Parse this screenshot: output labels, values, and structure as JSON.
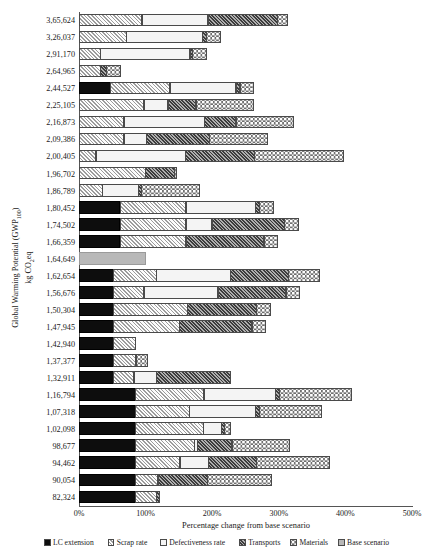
{
  "axes": {
    "y_title_line1": "Global Warming Potential (GWP",
    "y_title_sub": "100",
    "y_title_line1_end": ")",
    "y_title_line2_a": "kg CO",
    "y_title_line2_sub": "2",
    "y_title_line2_b": "eq",
    "x_title": "Percentage change from base scenario",
    "x_ticks": [
      "0%",
      "100%",
      "200%",
      "300%",
      "400%",
      "500%"
    ],
    "x_min": 0,
    "x_max": 500
  },
  "legend": {
    "items": [
      {
        "label": "LC extension",
        "key": "lc-extension",
        "color": "#0d0d0d"
      },
      {
        "label": "Scrap rate",
        "key": "scrap-rate",
        "color": "#c9c9c9"
      },
      {
        "label": "Defectiveness rate",
        "key": "defectiveness-rate",
        "color": "#f4f4f4"
      },
      {
        "label": "Transports",
        "key": "transports",
        "color": "#6e6e6e"
      },
      {
        "label": "Materials",
        "key": "materials",
        "color": "#f2f2f2"
      },
      {
        "label": "Base scenario",
        "key": "base-scenario",
        "color": "#b8b8b8"
      }
    ]
  },
  "chart_data": {
    "type": "bar",
    "orientation": "horizontal",
    "stacked": true,
    "title": "",
    "xlabel": "Percentage change from base scenario",
    "ylabel": "Global Warming Potential (GWP100) kg CO2eq",
    "xlim": [
      0,
      500
    ],
    "xticks": [
      0,
      100,
      200,
      300,
      400,
      500
    ],
    "grid": false,
    "legend_position": "bottom",
    "series": [
      {
        "name": "LC extension",
        "values": [
          0,
          0,
          0,
          0,
          48,
          0,
          0,
          0,
          0,
          0,
          0,
          62,
          62,
          62,
          0,
          52,
          52,
          52,
          52,
          52,
          52,
          52,
          85,
          85,
          85,
          85,
          85,
          85,
          85
        ]
      },
      {
        "name": "Scrap rate",
        "values": [
          95,
          72,
          33,
          33,
          90,
          98,
          68,
          68,
          26,
          100,
          36,
          100,
          100,
          100,
          0,
          66,
          47,
          112,
          100,
          35,
          35,
          32,
          104,
          82,
          103,
          90,
          68,
          35,
          33
        ]
      },
      {
        "name": "Defectiveness rate",
        "values": [
          100,
          115,
          135,
          0,
          100,
          37,
          122,
          35,
          135,
          0,
          55,
          105,
          40,
          0,
          0,
          112,
          112,
          0,
          0,
          0,
          0,
          0,
          108,
          100,
          28,
          88,
          44,
          48,
          0
        ]
      },
      {
        "name": "Transports",
        "values": [
          105,
          7,
          5,
          10,
          7,
          43,
          48,
          95,
          105,
          45,
          5,
          7,
          110,
          118,
          0,
          88,
          103,
          105,
          110,
          0,
          0,
          0,
          7,
          7,
          0,
          53,
          73,
          75,
          6
        ]
      },
      {
        "name": "Materials",
        "values": [
          17,
          22,
          22,
          22,
          22,
          87,
          88,
          88,
          135,
          0,
          88,
          22,
          22,
          22,
          0,
          88,
          88,
          22,
          22,
          0,
          0,
          0,
          110,
          95,
          22,
          88,
          110,
          0,
          0
        ]
      },
      {
        "name": "Base scenario",
        "values": [
          0,
          0,
          0,
          0,
          0,
          0,
          0,
          0,
          0,
          0,
          0,
          0,
          0,
          0,
          100,
          0,
          0,
          0,
          0,
          0,
          0,
          0,
          0,
          0,
          0,
          0,
          0,
          0,
          0
        ]
      }
    ],
    "categories": [
      "3,65,624",
      "3,26,037",
      "2,91,170",
      "2,64,965",
      "2,44,527",
      "2,25,105",
      "2,16,873",
      "2,09,386",
      "2,00,405",
      "1,96,702",
      "1,86,789",
      "1,80,452",
      "1,74,502",
      "1,66,359",
      "1,64,649",
      "1,62,654",
      "1,56,676",
      "1,50,304",
      "1,47,945",
      "1,42,940",
      "1,37,377",
      "1,32,911",
      "1,16,794",
      "1,07,318",
      "1,02,098",
      "98,677",
      "94,462",
      "90,054",
      "82,324"
    ]
  },
  "rows": [
    {
      "label": "3,65,624",
      "segs": [
        {
          "k": "scrap",
          "v": 95
        },
        {
          "k": "def",
          "v": 100
        },
        {
          "k": "trans",
          "v": 105
        },
        {
          "k": "mat",
          "v": 17
        }
      ]
    },
    {
      "label": "3,26,037",
      "segs": [
        {
          "k": "scrap",
          "v": 72
        },
        {
          "k": "def",
          "v": 115
        },
        {
          "k": "trans",
          "v": 7
        },
        {
          "k": "mat",
          "v": 22
        }
      ]
    },
    {
      "label": "2,91,170",
      "segs": [
        {
          "k": "scrap",
          "v": 33
        },
        {
          "k": "def",
          "v": 135
        },
        {
          "k": "trans",
          "v": 5
        },
        {
          "k": "mat",
          "v": 22
        }
      ]
    },
    {
      "label": "2,64,965",
      "segs": [
        {
          "k": "scrap",
          "v": 33
        },
        {
          "k": "trans",
          "v": 10
        },
        {
          "k": "mat",
          "v": 22
        }
      ]
    },
    {
      "label": "2,44,527",
      "segs": [
        {
          "k": "lc",
          "v": 48
        },
        {
          "k": "scrap",
          "v": 90
        },
        {
          "k": "def",
          "v": 100
        },
        {
          "k": "trans",
          "v": 7
        },
        {
          "k": "mat",
          "v": 22
        }
      ]
    },
    {
      "label": "2,25,105",
      "segs": [
        {
          "k": "scrap",
          "v": 98
        },
        {
          "k": "def",
          "v": 37
        },
        {
          "k": "trans",
          "v": 43
        },
        {
          "k": "mat",
          "v": 87
        }
      ]
    },
    {
      "label": "2,16,873",
      "segs": [
        {
          "k": "scrap",
          "v": 68
        },
        {
          "k": "def",
          "v": 122
        },
        {
          "k": "trans",
          "v": 48
        },
        {
          "k": "mat",
          "v": 88
        }
      ]
    },
    {
      "label": "2,09,386",
      "segs": [
        {
          "k": "scrap",
          "v": 68
        },
        {
          "k": "def",
          "v": 35
        },
        {
          "k": "trans",
          "v": 95
        },
        {
          "k": "mat",
          "v": 88
        }
      ]
    },
    {
      "label": "2,00,405",
      "segs": [
        {
          "k": "scrap",
          "v": 26
        },
        {
          "k": "def",
          "v": 135
        },
        {
          "k": "trans",
          "v": 105
        },
        {
          "k": "mat",
          "v": 135
        }
      ]
    },
    {
      "label": "1,96,702",
      "segs": [
        {
          "k": "scrap",
          "v": 100
        },
        {
          "k": "trans",
          "v": 45
        },
        {
          "k": "mat",
          "v": 4
        }
      ]
    },
    {
      "label": "1,86,789",
      "segs": [
        {
          "k": "scrap",
          "v": 36
        },
        {
          "k": "def",
          "v": 55
        },
        {
          "k": "trans",
          "v": 5
        },
        {
          "k": "mat",
          "v": 88
        }
      ]
    },
    {
      "label": "1,80,452",
      "segs": [
        {
          "k": "lc",
          "v": 62
        },
        {
          "k": "scrap",
          "v": 100
        },
        {
          "k": "def",
          "v": 105
        },
        {
          "k": "trans",
          "v": 7
        },
        {
          "k": "mat",
          "v": 22
        }
      ]
    },
    {
      "label": "1,74,502",
      "segs": [
        {
          "k": "lc",
          "v": 62
        },
        {
          "k": "scrap",
          "v": 100
        },
        {
          "k": "def",
          "v": 40
        },
        {
          "k": "trans",
          "v": 110
        },
        {
          "k": "mat",
          "v": 22
        }
      ]
    },
    {
      "label": "1,66,359",
      "segs": [
        {
          "k": "lc",
          "v": 62
        },
        {
          "k": "scrap",
          "v": 100
        },
        {
          "k": "trans",
          "v": 118
        },
        {
          "k": "mat",
          "v": 22
        }
      ]
    },
    {
      "label": "1,64,649",
      "segs": [
        {
          "k": "base",
          "v": 100
        }
      ]
    },
    {
      "label": "1,62,654",
      "segs": [
        {
          "k": "lc",
          "v": 52
        },
        {
          "k": "scrap",
          "v": 66
        },
        {
          "k": "def",
          "v": 112
        },
        {
          "k": "trans",
          "v": 88
        },
        {
          "k": "mat",
          "v": 48
        }
      ]
    },
    {
      "label": "1,56,676",
      "segs": [
        {
          "k": "lc",
          "v": 52
        },
        {
          "k": "scrap",
          "v": 47
        },
        {
          "k": "def",
          "v": 112
        },
        {
          "k": "trans",
          "v": 103
        },
        {
          "k": "mat",
          "v": 22
        }
      ]
    },
    {
      "label": "1,50,304",
      "segs": [
        {
          "k": "lc",
          "v": 52
        },
        {
          "k": "scrap",
          "v": 112
        },
        {
          "k": "trans",
          "v": 105
        },
        {
          "k": "mat",
          "v": 22
        }
      ]
    },
    {
      "label": "1,47,945",
      "segs": [
        {
          "k": "lc",
          "v": 52
        },
        {
          "k": "scrap",
          "v": 100
        },
        {
          "k": "trans",
          "v": 110
        },
        {
          "k": "mat",
          "v": 22
        }
      ]
    },
    {
      "label": "1,42,940",
      "segs": [
        {
          "k": "lc",
          "v": 52
        },
        {
          "k": "scrap",
          "v": 35
        }
      ]
    },
    {
      "label": "1,37,377",
      "segs": [
        {
          "k": "lc",
          "v": 52
        },
        {
          "k": "scrap",
          "v": 35
        },
        {
          "k": "mat",
          "v": 18
        }
      ]
    },
    {
      "label": "1,32,911",
      "segs": [
        {
          "k": "lc",
          "v": 52
        },
        {
          "k": "scrap",
          "v": 32
        },
        {
          "k": "def",
          "v": 35
        },
        {
          "k": "trans",
          "v": 112
        }
      ]
    },
    {
      "label": "1,16,794",
      "segs": [
        {
          "k": "lc",
          "v": 85
        },
        {
          "k": "scrap",
          "v": 104
        },
        {
          "k": "def",
          "v": 108
        },
        {
          "k": "trans",
          "v": 7
        },
        {
          "k": "mat",
          "v": 110
        }
      ]
    },
    {
      "label": "1,07,318",
      "segs": [
        {
          "k": "lc",
          "v": 85
        },
        {
          "k": "scrap",
          "v": 82
        },
        {
          "k": "def",
          "v": 100
        },
        {
          "k": "trans",
          "v": 7
        },
        {
          "k": "mat",
          "v": 95
        }
      ]
    },
    {
      "label": "1,02,098",
      "segs": [
        {
          "k": "lc",
          "v": 85
        },
        {
          "k": "scrap",
          "v": 103
        },
        {
          "k": "def",
          "v": 28
        },
        {
          "k": "trans",
          "v": 6
        },
        {
          "k": "mat",
          "v": 10
        }
      ]
    },
    {
      "label": "98,677",
      "segs": [
        {
          "k": "lc",
          "v": 85
        },
        {
          "k": "scrap",
          "v": 90
        },
        {
          "k": "def",
          "v": 5
        },
        {
          "k": "trans",
          "v": 53
        },
        {
          "k": "mat",
          "v": 88
        }
      ]
    },
    {
      "label": "94,462",
      "segs": [
        {
          "k": "lc",
          "v": 85
        },
        {
          "k": "scrap",
          "v": 68
        },
        {
          "k": "def",
          "v": 44
        },
        {
          "k": "trans",
          "v": 73
        },
        {
          "k": "mat",
          "v": 110
        }
      ]
    },
    {
      "label": "90,054",
      "segs": [
        {
          "k": "lc",
          "v": 85
        },
        {
          "k": "scrap",
          "v": 35
        },
        {
          "k": "trans",
          "v": 75
        },
        {
          "k": "mat",
          "v": 97
        }
      ]
    },
    {
      "label": "82,324",
      "segs": [
        {
          "k": "lc",
          "v": 85
        },
        {
          "k": "scrap",
          "v": 33
        },
        {
          "k": "trans",
          "v": 6
        }
      ]
    }
  ]
}
